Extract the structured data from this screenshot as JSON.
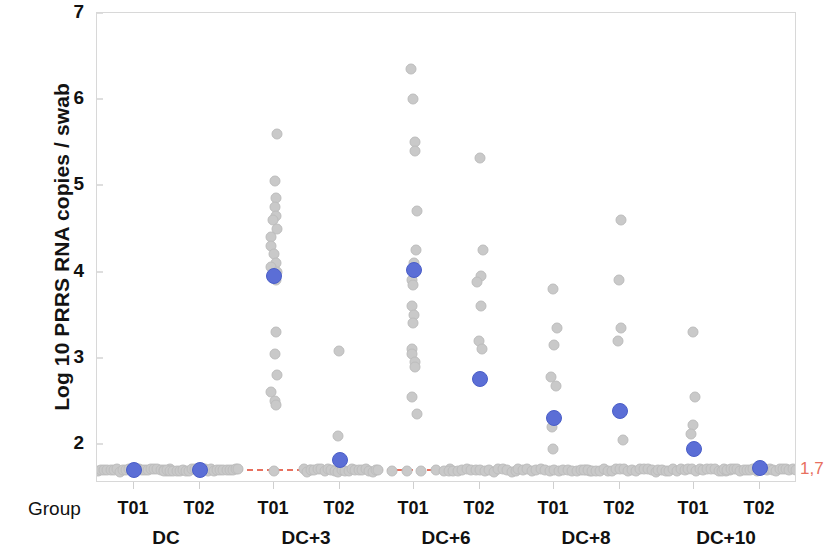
{
  "chart_data": {
    "type": "scatter",
    "title": "",
    "xlabel": "Group",
    "ylabel": "Log 10 PRRS RNA copies / swab",
    "ylim": [
      1.55,
      7.0
    ],
    "yticks": [
      2,
      3,
      4,
      5,
      6,
      7
    ],
    "grid": false,
    "legend": "none",
    "reference_line": {
      "value": 1.7,
      "label": "1,7",
      "color": "#e8705f",
      "style": "dashed"
    },
    "colors": {
      "point": "#c9c9c9",
      "mean_point": "#5b6ed6",
      "reference": "#e8705f",
      "frame": "#d8d8d8",
      "text": "#111111"
    },
    "x_group_labels": [
      "DC",
      "DC+3",
      "DC+6",
      "DC+8",
      "DC+10"
    ],
    "x_sub_labels": [
      "T01",
      "T02"
    ],
    "series": [
      {
        "name": "DC / T01",
        "group": "DC",
        "treatment": "T01",
        "mean": 1.7,
        "values": [
          1.7,
          1.7,
          1.7,
          1.7,
          1.7,
          1.7,
          1.7,
          1.7,
          1.7,
          1.7,
          1.7,
          1.7,
          1.7,
          1.7,
          1.7,
          1.7,
          1.7,
          1.7,
          1.7,
          1.7,
          1.7,
          1.7,
          1.7,
          1.7
        ]
      },
      {
        "name": "DC / T02",
        "group": "DC",
        "treatment": "T02",
        "mean": 1.7,
        "values": [
          1.7,
          1.7,
          1.7,
          1.7,
          1.7,
          1.7,
          1.7,
          1.7,
          1.7,
          1.7,
          1.7,
          1.7,
          1.7,
          1.7,
          1.7,
          1.7,
          1.7,
          1.7,
          1.7,
          1.7,
          1.7,
          1.7,
          1.7,
          1.7
        ]
      },
      {
        "name": "DC+3 / T01",
        "group": "DC+3",
        "treatment": "T01",
        "mean": 3.95,
        "values": [
          5.6,
          5.05,
          4.85,
          4.75,
          4.65,
          4.6,
          4.5,
          4.4,
          4.3,
          4.2,
          4.1,
          4.05,
          4.0,
          3.95,
          3.9,
          3.3,
          3.05,
          2.8,
          2.6,
          2.5,
          2.45,
          1.7,
          1.7,
          1.7
        ]
      },
      {
        "name": "DC+3 / T02",
        "group": "DC+3",
        "treatment": "T02",
        "mean": 1.82,
        "values": [
          3.08,
          2.1,
          1.7,
          1.7,
          1.7,
          1.7,
          1.7,
          1.7,
          1.7,
          1.7,
          1.7,
          1.7,
          1.7,
          1.7,
          1.7,
          1.7,
          1.7,
          1.7,
          1.7,
          1.7,
          1.7,
          1.7,
          1.7,
          1.7
        ]
      },
      {
        "name": "DC+6 / T01",
        "group": "DC+6",
        "treatment": "T01",
        "mean": 4.02,
        "values": [
          6.35,
          6.0,
          5.5,
          5.4,
          4.7,
          4.25,
          4.1,
          3.9,
          3.85,
          3.6,
          3.5,
          3.4,
          3.1,
          3.05,
          2.95,
          2.9,
          2.55,
          2.35,
          1.7,
          1.7,
          1.7,
          1.7,
          1.7,
          1.7
        ]
      },
      {
        "name": "DC+6 / T02",
        "group": "DC+6",
        "treatment": "T02",
        "mean": 2.76,
        "values": [
          5.32,
          4.25,
          3.95,
          3.88,
          3.6,
          3.2,
          3.1,
          1.7,
          1.7,
          1.7,
          1.7,
          1.7,
          1.7,
          1.7,
          1.7,
          1.7,
          1.7,
          1.7,
          1.7,
          1.7,
          1.7,
          1.7,
          1.7,
          1.7
        ]
      },
      {
        "name": "DC+8 / T01",
        "group": "DC+8",
        "treatment": "T01",
        "mean": 2.3,
        "values": [
          3.8,
          3.35,
          3.15,
          2.78,
          2.68,
          2.2,
          1.95,
          1.7,
          1.7,
          1.7,
          1.7,
          1.7,
          1.7,
          1.7,
          1.7,
          1.7,
          1.7,
          1.7,
          1.7,
          1.7,
          1.7,
          1.7,
          1.7,
          1.7
        ]
      },
      {
        "name": "DC+8 / T02",
        "group": "DC+8",
        "treatment": "T02",
        "mean": 2.39,
        "values": [
          4.6,
          3.9,
          3.35,
          3.2,
          2.05,
          1.7,
          1.7,
          1.7,
          1.7,
          1.7,
          1.7,
          1.7,
          1.7,
          1.7,
          1.7,
          1.7,
          1.7,
          1.7,
          1.7,
          1.7,
          1.7,
          1.7,
          1.7,
          1.7
        ]
      },
      {
        "name": "DC+10 / T01",
        "group": "DC+10",
        "treatment": "T01",
        "mean": 1.94,
        "values": [
          3.3,
          2.55,
          2.22,
          2.12,
          1.7,
          1.7,
          1.7,
          1.7,
          1.7,
          1.7,
          1.7,
          1.7,
          1.7,
          1.7,
          1.7,
          1.7,
          1.7,
          1.7,
          1.7,
          1.7,
          1.7,
          1.7,
          1.7,
          1.7
        ]
      },
      {
        "name": "DC+10 / T02",
        "group": "DC+10",
        "treatment": "T02",
        "mean": 1.72,
        "values": [
          1.7,
          1.7,
          1.7,
          1.7,
          1.7,
          1.7,
          1.7,
          1.7,
          1.7,
          1.7,
          1.7,
          1.7,
          1.7,
          1.7,
          1.7,
          1.7,
          1.7,
          1.7,
          1.7,
          1.7,
          1.7,
          1.7,
          1.7
        ]
      }
    ]
  },
  "axis": {
    "y_title": "Log 10 PRRS RNA copies / swab",
    "group_caption": "Group",
    "tick_2": "2",
    "tick_3": "3",
    "tick_4": "4",
    "tick_5": "5",
    "tick_6": "6",
    "tick_7": "7"
  }
}
